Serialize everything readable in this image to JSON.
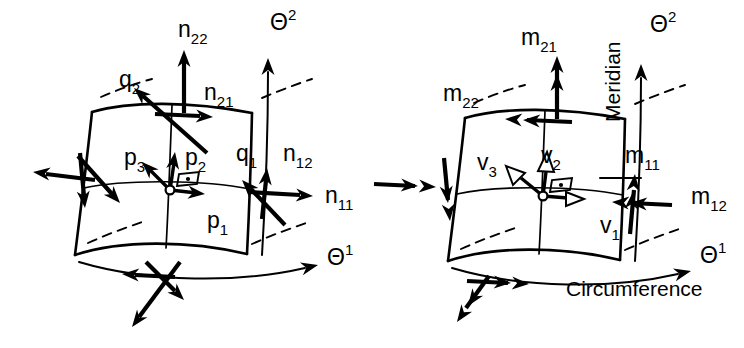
{
  "figure": {
    "background_color": "#ffffff",
    "ink_color": "#000000",
    "width": 744,
    "height": 348
  },
  "panels": [
    {
      "id": "left",
      "name": "force-resultants-panel",
      "description": "Shell element with membrane force resultants n, transverse shear q and base vectors p",
      "axes": [
        {
          "name": "theta-1-axis",
          "base": "Θ",
          "exponent": "1"
        },
        {
          "name": "theta-2-axis",
          "base": "Θ",
          "exponent": "2"
        }
      ],
      "labels": [
        {
          "id": "n22",
          "base": "n",
          "sub": "22",
          "x": 178,
          "y": 37
        },
        {
          "id": "theta2",
          "base": "Θ",
          "sup": "2",
          "x": 270,
          "y": 30
        },
        {
          "id": "q2",
          "base": "q",
          "sub": "2",
          "x": 119,
          "y": 87
        },
        {
          "id": "n21",
          "base": "n",
          "sub": "21",
          "x": 204,
          "y": 100
        },
        {
          "id": "p3",
          "base": "p",
          "sub": "3",
          "x": 124,
          "y": 165
        },
        {
          "id": "p2",
          "base": "p",
          "sub": "2",
          "x": 185,
          "y": 165
        },
        {
          "id": "q1",
          "base": "q",
          "sub": "1",
          "x": 236,
          "y": 161
        },
        {
          "id": "n12",
          "base": "n",
          "sub": "12",
          "x": 283,
          "y": 161
        },
        {
          "id": "n11",
          "base": "n",
          "sub": "11",
          "x": 325,
          "y": 203
        },
        {
          "id": "p1",
          "base": "p",
          "sub": "1",
          "x": 207,
          "y": 228
        },
        {
          "id": "theta1",
          "base": "Θ",
          "sup": "1",
          "x": 327,
          "y": 265
        }
      ]
    },
    {
      "id": "right",
      "name": "moment-resultants-panel",
      "description": "Shell element with moment resultants m (double-headed arrows) and director vectors v",
      "axes": [
        {
          "name": "theta-1-axis",
          "base": "Θ",
          "exponent": "1"
        },
        {
          "name": "theta-2-axis",
          "base": "Θ",
          "exponent": "2"
        }
      ],
      "annotations": [
        {
          "id": "meridian",
          "text": "Meridian",
          "orientation": "vertical",
          "x": 620,
          "y": 122
        },
        {
          "id": "circumference",
          "text": "Circumference",
          "orientation": "horizontal",
          "x": 566,
          "y": 296
        }
      ],
      "labels": [
        {
          "id": "m21",
          "base": "m",
          "sub": "21",
          "x": 521,
          "y": 45
        },
        {
          "id": "theta2",
          "base": "Θ",
          "sup": "2",
          "x": 650,
          "y": 32
        },
        {
          "id": "m22",
          "base": "m",
          "sub": "22",
          "x": 443,
          "y": 101
        },
        {
          "id": "v3",
          "base": "v",
          "sub": "3",
          "x": 477,
          "y": 170
        },
        {
          "id": "v2",
          "base": "v",
          "sub": "2",
          "x": 541,
          "y": 163
        },
        {
          "id": "m11",
          "base": "m",
          "sub": "11",
          "x": 625,
          "y": 163
        },
        {
          "id": "m12",
          "base": "m",
          "sub": "12",
          "x": 691,
          "y": 204
        },
        {
          "id": "v1",
          "base": "v",
          "sub": "1",
          "x": 600,
          "y": 233
        },
        {
          "id": "theta1",
          "base": "Θ",
          "sup": "1",
          "x": 700,
          "y": 263
        }
      ]
    }
  ],
  "legend_notes": {
    "single_head": "single arrowhead denotes force resultant",
    "double_head": "double arrowhead denotes moment resultant",
    "hollow_head": "hollow arrowhead denotes base/director vector"
  }
}
